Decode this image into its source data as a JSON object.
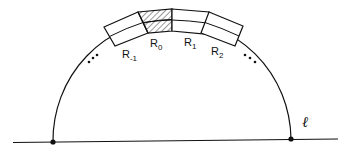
{
  "diagram": {
    "type": "semicircle-with-annular-regions",
    "line_label": "ℓ",
    "regions": [
      {
        "id": "R-1",
        "base": "R",
        "subscript": "-1",
        "hatched": false
      },
      {
        "id": "R0",
        "base": "R",
        "subscript": "0",
        "hatched": true
      },
      {
        "id": "R1",
        "base": "R",
        "subscript": "1",
        "hatched": false
      },
      {
        "id": "R2",
        "base": "R",
        "subscript": "2",
        "hatched": false
      }
    ],
    "ellipsis_left": "⋯",
    "ellipsis_right": "⋯",
    "endpoints": [
      "left-endpoint",
      "right-endpoint"
    ],
    "colors": {
      "stroke": "#111111",
      "background": "#ffffff",
      "hatch": "#333333"
    }
  }
}
